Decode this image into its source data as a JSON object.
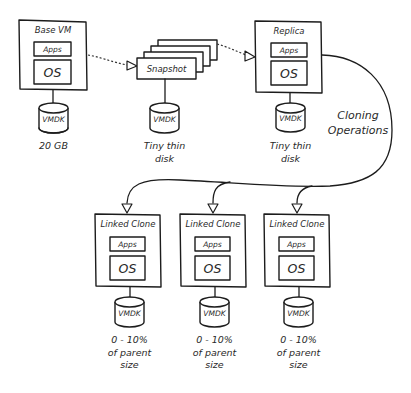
{
  "diagram": {
    "base_vm": {
      "title": "Base VM",
      "apps": "Apps",
      "os": "OS",
      "disk": "VMDK",
      "disk_caption": [
        "20 GB"
      ]
    },
    "snapshot": {
      "label": "Snapshot",
      "disk": "VMDK",
      "disk_caption": [
        "Tiny thin",
        "disk"
      ]
    },
    "replica": {
      "title": "Replica",
      "apps": "Apps",
      "os": "OS",
      "disk": "VMDK",
      "disk_caption": [
        "Tiny thin",
        "disk"
      ]
    },
    "cloning_label": [
      "Cloning",
      "Operations"
    ],
    "linked_clones": [
      {
        "title": "Linked Clone",
        "apps": "Apps",
        "os": "OS",
        "disk": "VMDK",
        "disk_caption": [
          "0 - 10%",
          "of parent",
          "size"
        ]
      },
      {
        "title": "Linked Clone",
        "apps": "Apps",
        "os": "OS",
        "disk": "VMDK",
        "disk_caption": [
          "0 - 10%",
          "of parent",
          "size"
        ]
      },
      {
        "title": "Linked Clone",
        "apps": "Apps",
        "os": "OS",
        "disk": "VMDK",
        "disk_caption": [
          "0 - 10%",
          "of parent",
          "size"
        ]
      }
    ],
    "colors": {
      "stroke": "#1c1c1c",
      "text": "#2a2a2a",
      "background": "#ffffff"
    }
  }
}
